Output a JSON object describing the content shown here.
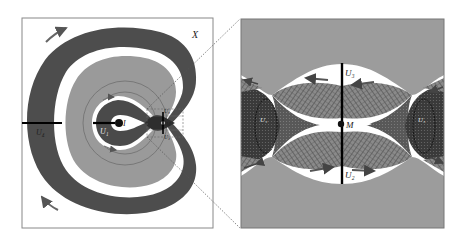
{
  "figure": {
    "left_panel": {
      "space_label": "X",
      "labels": {
        "u1": "U₁",
        "u2": "U₂",
        "u3": "U₃",
        "u4": "U₄",
        "fixed_point": "I",
        "saddle": "M"
      },
      "flow_arrows": [
        "top-left-clockwise",
        "bottom-left-clockwise",
        "inner-top",
        "inner-bottom"
      ]
    },
    "right_panel": {
      "description": "magnified view of neighborhood of M",
      "labels": {
        "u3": "U₃",
        "u2": "U₂",
        "saddle": "M",
        "left_ellipse": "U₄",
        "right_ellipse": "U₅"
      },
      "flow_arrows": [
        "upper-left",
        "upper-right",
        "lower-left",
        "lower-right",
        "edge-upper-left",
        "edge-upper-right",
        "edge-lower-left",
        "edge-lower-right"
      ]
    },
    "colors": {
      "outer_band": "#4d4d4d",
      "middle_band": "#9a9a9a",
      "inner_dark": "#4a4a4a",
      "white": "#ffffff",
      "frame": "#888888",
      "right_bg": "#9c9c9c",
      "mesh": "#6a6a6a"
    }
  }
}
